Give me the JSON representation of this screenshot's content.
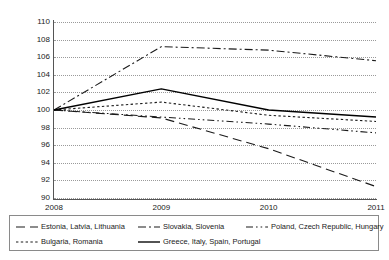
{
  "chart_data": {
    "type": "line",
    "title": "",
    "subtitle": "",
    "xlabel": "",
    "ylabel": "",
    "x": [
      "2008",
      "2009",
      "2010",
      "2011"
    ],
    "categories": [
      "2008",
      "2009",
      "2010",
      "2011"
    ],
    "ylim": [
      90,
      110
    ],
    "yticks": [
      90,
      92,
      94,
      96,
      98,
      100,
      102,
      104,
      106,
      108,
      110
    ],
    "grid": "horizontal-dotted",
    "legend_position": "bottom",
    "series": [
      {
        "name": "Estonia, Latvia, Lithuania",
        "style": "long-dash",
        "color": "#1a1a1a",
        "values": [
          100,
          99.1,
          95.6,
          91.3
        ]
      },
      {
        "name": "Slovakia, Slovenia",
        "style": "dash-dot",
        "color": "#1a1a1a",
        "values": [
          100,
          107.2,
          106.8,
          105.6
        ]
      },
      {
        "name": "Poland, Czech Republic, Hungary",
        "style": "dash-dot-dot",
        "color": "#1a1a1a",
        "values": [
          100,
          99.2,
          98.4,
          97.4
        ]
      },
      {
        "name": "Bulgaria, Romania",
        "style": "dotted",
        "color": "#1a1a1a",
        "values": [
          100,
          100.9,
          99.4,
          98.7
        ]
      },
      {
        "name": "Greece, Italy, Spain, Portugal",
        "style": "solid",
        "color": "#000000",
        "values": [
          100,
          102.4,
          100.0,
          99.2
        ]
      }
    ]
  },
  "legend": {
    "rows": [
      [
        {
          "label": "Estonia, Latvia, Lithuania",
          "style": "long-dash"
        },
        {
          "label": "Slovakia, Slovenia",
          "style": "dash-dot"
        },
        {
          "label": "Poland, Czech Republic, Hungary",
          "style": "dash-dot-dot"
        }
      ],
      [
        {
          "label": "Bulgaria, Romania",
          "style": "dotted"
        },
        {
          "label": "Greece, Italy, Spain, Portugal",
          "style": "solid"
        }
      ]
    ]
  }
}
